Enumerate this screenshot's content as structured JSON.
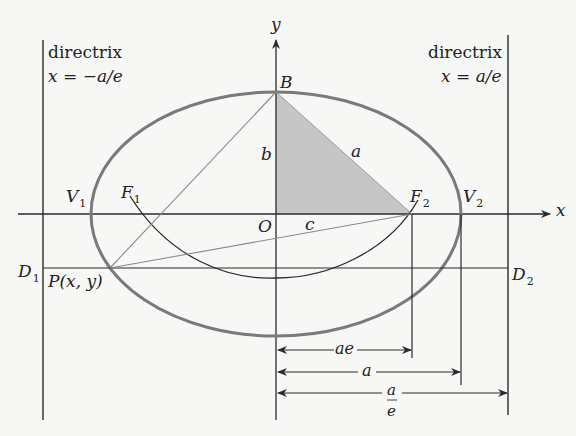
{
  "diagram": {
    "directrix_left": {
      "label": "directrix",
      "equation": "x = −a/e"
    },
    "directrix_right": {
      "label": "directrix",
      "equation": "x = a/e"
    },
    "axes": {
      "x_label": "x",
      "y_label": "y",
      "origin_label": "O"
    },
    "points": {
      "B": "B",
      "F1": {
        "main": "F",
        "sub": "1"
      },
      "F2": {
        "main": "F",
        "sub": "2"
      },
      "V1": {
        "main": "V",
        "sub": "1"
      },
      "V2": {
        "main": "V",
        "sub": "2"
      },
      "D1": {
        "main": "D",
        "sub": "1"
      },
      "D2": {
        "main": "D",
        "sub": "2"
      },
      "P": "P(x, y)"
    },
    "segments": {
      "b": "b",
      "a": "a",
      "c": "c"
    },
    "dimensions": {
      "ae": "ae",
      "a": "a",
      "a_over_e_num": "a",
      "a_over_e_den": "e"
    },
    "colors": {
      "ellipse": "#7a7a7a",
      "lines": "#2a2a2a",
      "shaded_triangle": "#bdbdbd",
      "background": "#f7f7f5"
    }
  }
}
